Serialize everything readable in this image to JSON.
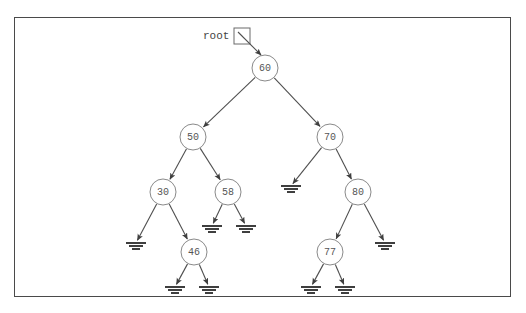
{
  "diagram": {
    "root_label": "root",
    "frame": {
      "x": 14,
      "y": 17,
      "width": 497,
      "height": 280,
      "border_color": "#4a4a4a"
    },
    "colors": {
      "node_stroke": "#8a8a8a",
      "node_fill": "#ffffff",
      "edge": "#4f4f4f",
      "text": "#555555",
      "ground": "#3f3f3f",
      "background": "#ffffff"
    },
    "root_pointer": {
      "label": "root",
      "label_x": 203,
      "label_y": 36,
      "box_x": 234,
      "box_y": 28,
      "box_size": 16,
      "arrow_from_x": 238,
      "arrow_from_y": 32,
      "arrow_to_x": 261,
      "arrow_to_y": 55
    },
    "node_radius": 13,
    "nodes": [
      {
        "id": "n60",
        "value": "60",
        "x": 265,
        "y": 68
      },
      {
        "id": "n50",
        "value": "50",
        "x": 193,
        "y": 137
      },
      {
        "id": "n70",
        "value": "70",
        "x": 330,
        "y": 137
      },
      {
        "id": "n30",
        "value": "30",
        "x": 163,
        "y": 192
      },
      {
        "id": "n58",
        "value": "58",
        "x": 228,
        "y": 192
      },
      {
        "id": "n80",
        "value": "80",
        "x": 358,
        "y": 192
      },
      {
        "id": "n46",
        "value": "46",
        "x": 194,
        "y": 252
      },
      {
        "id": "n77",
        "value": "77",
        "x": 330,
        "y": 252
      }
    ],
    "nulls": [
      {
        "id": "g30L",
        "x": 136,
        "y": 243
      },
      {
        "id": "g58L",
        "x": 212,
        "y": 226
      },
      {
        "id": "g58R",
        "x": 246,
        "y": 226
      },
      {
        "id": "g46L",
        "x": 175,
        "y": 287
      },
      {
        "id": "g46R",
        "x": 209,
        "y": 287
      },
      {
        "id": "g70L",
        "x": 291,
        "y": 186
      },
      {
        "id": "g80R",
        "x": 385,
        "y": 243
      },
      {
        "id": "g77L",
        "x": 311,
        "y": 287
      },
      {
        "id": "g77R",
        "x": 345,
        "y": 287
      }
    ],
    "edges": [
      {
        "from": "n60",
        "to": "n50"
      },
      {
        "from": "n60",
        "to": "n70"
      },
      {
        "from": "n50",
        "to": "n30"
      },
      {
        "from": "n50",
        "to": "n58"
      },
      {
        "from": "n70",
        "to": "g70L"
      },
      {
        "from": "n70",
        "to": "n80"
      },
      {
        "from": "n30",
        "to": "g30L"
      },
      {
        "from": "n30",
        "to": "n46"
      },
      {
        "from": "n58",
        "to": "g58L"
      },
      {
        "from": "n58",
        "to": "g58R"
      },
      {
        "from": "n80",
        "to": "n77"
      },
      {
        "from": "n80",
        "to": "g80R"
      },
      {
        "from": "n46",
        "to": "g46L"
      },
      {
        "from": "n46",
        "to": "g46R"
      },
      {
        "from": "n77",
        "to": "g77L"
      },
      {
        "from": "n77",
        "to": "g77R"
      }
    ],
    "ground_symbol": {
      "bars": [
        {
          "half_width": 10,
          "dy": 0,
          "thickness": 2
        },
        {
          "half_width": 7,
          "dy": 3,
          "thickness": 2
        },
        {
          "half_width": 4,
          "dy": 6,
          "thickness": 2
        }
      ]
    }
  }
}
